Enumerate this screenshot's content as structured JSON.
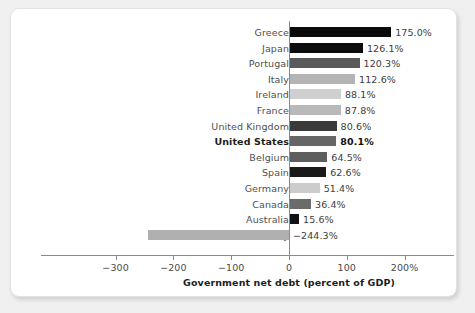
{
  "chart_data": {
    "type": "bar",
    "orientation": "horizontal",
    "title": "",
    "xlabel": "Government net debt (percent of GDP)",
    "ylabel": "",
    "xlim": [
      -300,
      200
    ],
    "xticks": [
      -300,
      -200,
      -100,
      0,
      100,
      200
    ],
    "xticklabels": [
      "−300",
      "−200",
      "−100",
      "0",
      "100",
      "200%"
    ],
    "grid": false,
    "legend": null,
    "highlight": "United States",
    "categories": [
      "Greece",
      "Japan",
      "Portugal",
      "Italy",
      "Ireland",
      "France",
      "United Kingdom",
      "United States",
      "Belgium",
      "Spain",
      "Germany",
      "Canada",
      "Australia",
      "Norway"
    ],
    "values": [
      175.0,
      126.1,
      120.3,
      112.6,
      88.1,
      87.8,
      80.6,
      80.1,
      64.5,
      62.6,
      51.4,
      36.4,
      15.6,
      -244.3
    ],
    "value_labels": [
      "175.0%",
      "126.1%",
      "120.3%",
      "112.6%",
      "88.1%",
      "87.8%",
      "80.6%",
      "80.1%",
      "64.5%",
      "62.6%",
      "51.4%",
      "36.4%",
      "15.6%",
      "−244.3%"
    ],
    "bar_colors": [
      "#0a0a0a",
      "#0d0d0d",
      "#5a5a5a",
      "#b4b4b4",
      "#cfcfcf",
      "#b9b9b9",
      "#3a3a3a",
      "#666666",
      "#5e5e5e",
      "#1a1a1a",
      "#cccccc",
      "#6b6b6b",
      "#111111",
      "#b0b0b0"
    ]
  },
  "colors": {
    "background": "#f0f0f0",
    "card": "#ffffff",
    "axis": "#8a8a8a",
    "text": "#4f4f4f",
    "highlight_text": "#1d1d1d"
  }
}
